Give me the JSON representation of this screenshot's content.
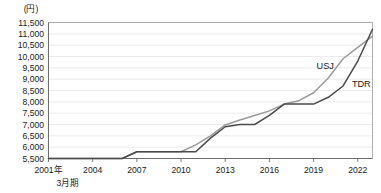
{
  "chart_data": {
    "type": "line",
    "title": "",
    "subtitle": "",
    "unit_label": "(円)",
    "xlabel": "",
    "ylabel": "",
    "grid": true,
    "legend_position": "inline-right",
    "ylim": [
      5500,
      11500
    ],
    "ytick_values": [
      5500,
      6000,
      6500,
      7000,
      7500,
      8000,
      8500,
      9000,
      9500,
      10000,
      10500,
      11000,
      11500
    ],
    "ytick_labels": [
      "5,500",
      "6,000",
      "6,500",
      "7,000",
      "7,500",
      "8,000",
      "8,500",
      "9,000",
      "9,500",
      "10,000",
      "10,500",
      "11,000",
      "11,500"
    ],
    "xlim": [
      2001,
      2023
    ],
    "xtick_values": [
      2001,
      2004,
      2007,
      2010,
      2013,
      2016,
      2019,
      2022
    ],
    "xtick_labels": [
      "2001年",
      "2004",
      "2007",
      "2010",
      "2013",
      "2016",
      "2019",
      "2022"
    ],
    "x_first_tick_sub_label": "3月期",
    "x": [
      2001,
      2002,
      2003,
      2004,
      2005,
      2006,
      2007,
      2008,
      2009,
      2010,
      2011,
      2012,
      2013,
      2014,
      2015,
      2016,
      2017,
      2018,
      2019,
      2020,
      2021,
      2022,
      2023
    ],
    "series": [
      {
        "name": "USJ",
        "label": "USJ",
        "color": "#9a9a9a",
        "label_x": 2019.2,
        "label_y": 9450,
        "values": [
          5500,
          5500,
          5500,
          5500,
          5500,
          5500,
          5800,
          5800,
          5800,
          5800,
          6100,
          6500,
          6980,
          7200,
          7400,
          7600,
          7900,
          8050,
          8400,
          9050,
          9900,
          10400,
          10900
        ]
      },
      {
        "name": "TDR",
        "label": "TDR",
        "color": "#4a4a4a",
        "label_x": 2021.6,
        "label_y": 8650,
        "values": [
          5500,
          5500,
          5500,
          5500,
          5500,
          5500,
          5800,
          5800,
          5800,
          5800,
          5800,
          6400,
          6900,
          7000,
          7000,
          7400,
          7900,
          7900,
          7900,
          8200,
          8700,
          9800,
          11200
        ]
      }
    ]
  }
}
